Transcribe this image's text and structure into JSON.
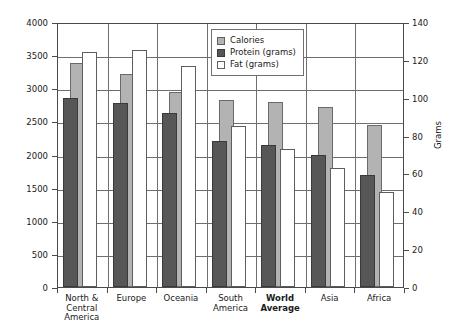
{
  "chart_data": {
    "type": "bar",
    "title": "",
    "subtitle": "",
    "xlabel": "",
    "ylabel": "Calories",
    "y2label": "Grams",
    "ylim": [
      0,
      4000
    ],
    "y2lim": [
      0,
      140
    ],
    "yticks": [
      0,
      500,
      1000,
      1500,
      2000,
      2500,
      3000,
      3500,
      4000
    ],
    "y2ticks": [
      0,
      20,
      40,
      60,
      80,
      100,
      120,
      140
    ],
    "grid": true,
    "legend_position": "top-center-right",
    "categories": [
      "North &\nCentral\nAmerica",
      "Europe",
      "Oceania",
      "South\nAmerica",
      "World\nAverage",
      "Asia",
      "Africa"
    ],
    "category_lines": [
      [
        "North &",
        "Central",
        "America"
      ],
      [
        "Europe"
      ],
      [
        "Oceania"
      ],
      [
        "South",
        "America"
      ],
      [
        "World",
        "Average"
      ],
      [
        "Asia"
      ],
      [
        "Africa"
      ]
    ],
    "emphasized_category": "World Average",
    "series": [
      {
        "name": "Calories",
        "axis": "left",
        "unit": "calories",
        "color": "#b3b3b3",
        "values": [
          3380,
          3210,
          2950,
          2820,
          2800,
          2720,
          2450
        ]
      },
      {
        "name": "Protein (grams)",
        "axis": "right",
        "unit": "grams",
        "color": "#575757",
        "values": [
          100,
          97,
          92,
          77,
          75,
          70,
          59
        ]
      },
      {
        "name": "Fat (grams)",
        "axis": "right",
        "unit": "grams",
        "color": "#ffffff",
        "values": [
          124,
          125,
          117,
          85,
          73,
          63,
          50
        ]
      }
    ]
  },
  "legend": {
    "items": [
      {
        "label": "Calories",
        "swatch": "calories"
      },
      {
        "label": "Protein (grams)",
        "swatch": "protein"
      },
      {
        "label": "Fat (grams)",
        "swatch": "fat"
      }
    ]
  },
  "caption": {
    "label": "",
    "text": ""
  }
}
